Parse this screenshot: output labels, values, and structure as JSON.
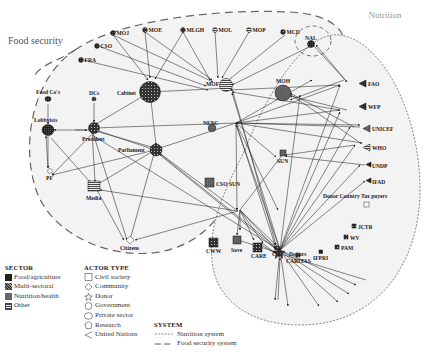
{
  "regions": {
    "food_security": {
      "label": "Food security"
    },
    "nutrition": {
      "label": "Nutrition"
    }
  },
  "nodes": {
    "moj": "MOJ",
    "moe": "MOE",
    "mlgh": "MLGH",
    "mol": "MOL",
    "mop": "MOP",
    "mcd": "MCD",
    "nal": "NAL",
    "cso": "CSO",
    "fra": "FRA",
    "mof": "MOF",
    "moh": "MOH",
    "food_cos": "Food Co's",
    "dcs": "DCs",
    "cabinet": "Cabinet",
    "lobbyists": "Lobbyists",
    "president": "President",
    "nfnc": "NFNC",
    "parliament": "Parliament",
    "pf": "PF",
    "media": "Media",
    "citizens": "Citizens",
    "cso_sun": "CSO SUN",
    "sun": "SUN",
    "donors": "Donors",
    "fao": "FAO",
    "wfp": "WFP",
    "unicef": "UNICEF",
    "who": "WHO",
    "undp": "UNDP",
    "ifad": "IFAD",
    "donor_tax": "Donor Country Tax payers",
    "cww": "CWW",
    "save": "Save",
    "care": "CARE",
    "crs": "CRS",
    "caritas": "CARITAS",
    "ifpri": "IFPRI",
    "pam": "PAM",
    "wv": "WV",
    "jctr": "JCTR"
  },
  "legend": {
    "sector": {
      "title": "SECTOR",
      "items": [
        {
          "label": "Food/agriculture",
          "pattern": "food"
        },
        {
          "label": "Multi-sectoral",
          "pattern": "multi"
        },
        {
          "label": "Nutrition/health",
          "pattern": "nutrition"
        },
        {
          "label": "Other",
          "pattern": "other"
        }
      ]
    },
    "actor_type": {
      "title": "ACTOR TYPE",
      "items": [
        {
          "label": "Civil society",
          "shape": "square"
        },
        {
          "label": "Community",
          "shape": "diamond"
        },
        {
          "label": "Donor",
          "shape": "star"
        },
        {
          "label": "Government",
          "shape": "circle"
        },
        {
          "label": "Private sector",
          "shape": "ellipse"
        },
        {
          "label": "Research",
          "shape": "pentagon"
        },
        {
          "label": "United Nations",
          "shape": "triangle-left"
        }
      ]
    },
    "system": {
      "title": "SYSTEM",
      "items": [
        {
          "label": "Nutrition system",
          "line": "dotted"
        },
        {
          "label": "Food security system",
          "line": "dashed"
        }
      ]
    }
  }
}
